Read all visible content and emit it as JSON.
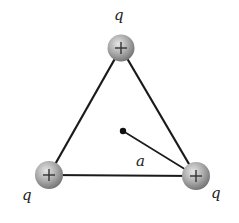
{
  "diagram": {
    "colors": {
      "line": "#1a1a1a",
      "sphere_light": "#e6e6e6",
      "sphere_mid": "#a8a8a8",
      "sphere_dark": "#6e6e6e",
      "text": "#222222"
    },
    "charges": [
      {
        "id": "top",
        "label": "q",
        "sign": "+",
        "cx": 121,
        "cy": 48,
        "label_x": 114,
        "label_y": 20
      },
      {
        "id": "bottom-left",
        "label": "q",
        "sign": "+",
        "cx": 49,
        "cy": 175,
        "label_x": 22,
        "label_y": 200
      },
      {
        "id": "bottom-right",
        "label": "q",
        "sign": "+",
        "cx": 196,
        "cy": 176,
        "label_x": 211,
        "label_y": 198
      }
    ],
    "center_point": {
      "cx": 123,
      "cy": 131
    },
    "distance_label": {
      "text": "a",
      "x": 136,
      "y": 166
    }
  }
}
